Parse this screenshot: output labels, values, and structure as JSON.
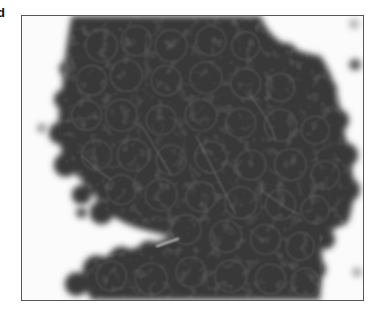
{
  "figure": {
    "panel_label": "d",
    "colors": {
      "background": "#fbfbfb",
      "cluster": "#383838",
      "cell_edge": "#4a4a4a",
      "highlight": "#6a6a6a",
      "frame": "#555555"
    }
  }
}
